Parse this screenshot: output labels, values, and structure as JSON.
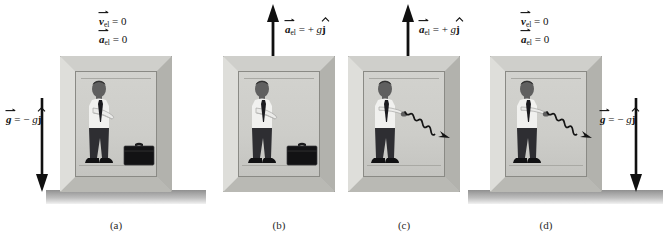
{
  "figure": {
    "background_color": "#ffffff",
    "width": 669,
    "height": 242
  },
  "colors": {
    "elevator_frame": "#c9c9c6",
    "elevator_interior": "#d0d0cc",
    "ground": "#a8a8a8",
    "arrow": "#101010",
    "person_shirt": "#f2f2f0",
    "person_trousers": "#2f2f33",
    "person_skin": "#6b6b6b",
    "tie": "#1c1c20",
    "briefcase": "#111113",
    "text": "#111111"
  },
  "panels": [
    {
      "id": "panel-a",
      "caption": "(a)",
      "state": "at rest",
      "labels": [
        {
          "symbol": "v",
          "subscript": "el",
          "relation": "= 0",
          "vector": true
        },
        {
          "symbol": "a",
          "subscript": "el",
          "relation": "= 0",
          "vector": true
        }
      ],
      "gravity_label": {
        "symbol": "g",
        "relation": "= −",
        "coefficient": "g",
        "unit_vector": "j"
      },
      "has_ground": true,
      "has_briefcase_on_floor": true,
      "has_thrown_briefcase": false,
      "motion_arrow": {
        "direction": "down",
        "kind": "gravity"
      }
    },
    {
      "id": "panel-b",
      "caption": "(b)",
      "state": "accelerating upward",
      "labels": [
        {
          "symbol": "a",
          "subscript": "el",
          "relation": "= +",
          "coefficient": "g",
          "unit_vector": "j",
          "vector": true
        }
      ],
      "gravity_label": null,
      "has_ground": false,
      "has_briefcase_on_floor": true,
      "has_thrown_briefcase": false,
      "motion_arrow": {
        "direction": "up",
        "kind": "acceleration"
      }
    },
    {
      "id": "panel-c",
      "caption": "(c)",
      "state": "accelerating upward, briefcase tossed",
      "labels": [
        {
          "symbol": "a",
          "subscript": "el",
          "relation": "= +",
          "coefficient": "g",
          "unit_vector": "j",
          "vector": true
        }
      ],
      "gravity_label": null,
      "has_ground": false,
      "has_briefcase_on_floor": false,
      "has_thrown_briefcase": true,
      "motion_arrow": {
        "direction": "up",
        "kind": "acceleration"
      }
    },
    {
      "id": "panel-d",
      "caption": "(d)",
      "state": "at rest, briefcase tossed",
      "labels": [
        {
          "symbol": "v",
          "subscript": "el",
          "relation": "= 0",
          "vector": true
        },
        {
          "symbol": "a",
          "subscript": "el",
          "relation": "= 0",
          "vector": true
        }
      ],
      "gravity_label": {
        "symbol": "g",
        "relation": "= −",
        "coefficient": "g",
        "unit_vector": "j"
      },
      "has_ground": true,
      "has_briefcase_on_floor": false,
      "has_thrown_briefcase": true,
      "motion_arrow": {
        "direction": "down",
        "kind": "gravity"
      }
    }
  ],
  "label_text": {
    "v_el_zero_line1": "= 0",
    "v_el_zero_line2": "= 0",
    "a_plus_gj": "= +",
    "g_minus_gj": "= −",
    "sub_el": "el",
    "g_italic": "g",
    "j_hat": "j",
    "v": "v",
    "a": "a",
    "g": "g"
  },
  "captions": [
    "(a)",
    "(b)",
    "(c)",
    "(d)"
  ]
}
